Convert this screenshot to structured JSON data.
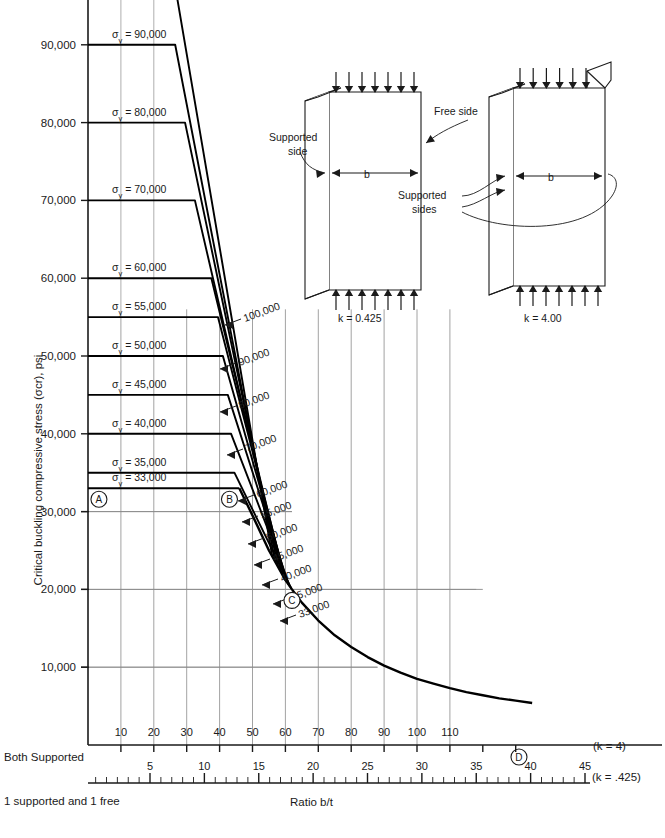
{
  "chart_data": {
    "type": "line",
    "title": "",
    "xlabel": "Ratio  b/t",
    "ylabel": "Critical buckling compressive stress (σcr), psi",
    "ylim": [
      0,
      100000
    ],
    "yticks": [
      "100,000",
      "90,000",
      "80,000",
      "70,000",
      "60,000",
      "50,000",
      "40,000",
      "30,000",
      "20,000",
      "10,000"
    ],
    "ytick_values": [
      100000,
      90000,
      80000,
      70000,
      60000,
      50000,
      40000,
      30000,
      20000,
      10000
    ],
    "xaxis_primary": {
      "note": "Both  Supported",
      "k_label": "(k  =  4)",
      "ticks": [
        10,
        20,
        30,
        40,
        50,
        60,
        70,
        80,
        90,
        100,
        110
      ],
      "tick_labels": [
        "10",
        "20",
        "30",
        "40",
        "50",
        "60",
        "70",
        "80",
        "90",
        "100",
        "110"
      ],
      "range": [
        0,
        135
      ]
    },
    "xaxis_secondary": {
      "note": "1 supported and 1 free",
      "k_label": "(k = .425)",
      "ticks": [
        5,
        10,
        15,
        20,
        25,
        30,
        35,
        40,
        45
      ],
      "tick_labels": [
        "5",
        "10",
        "15",
        "20",
        "25",
        "30",
        "35",
        "40",
        "45"
      ],
      "range": [
        0,
        46.5
      ]
    },
    "gridlines": {
      "x": [
        10,
        20,
        30,
        40,
        50,
        60,
        70,
        80,
        90,
        100,
        110
      ],
      "y": [
        10000,
        20000,
        30000,
        60000
      ]
    },
    "series": [
      {
        "name": "100,000",
        "sigma_y": 100000,
        "plateau_label": "σy = 100,000",
        "curve_label": "100,000",
        "break_bt": 25.5
      },
      {
        "name": "90,000",
        "sigma_y": 90000,
        "plateau_label": "σy = 90,000",
        "curve_label": "90,000",
        "break_bt": 26.5
      },
      {
        "name": "80,000",
        "sigma_y": 80000,
        "plateau_label": "σy = 80,000",
        "curve_label": "80,000",
        "break_bt": 29.5
      },
      {
        "name": "70,000",
        "sigma_y": 70000,
        "plateau_label": "σy = 70,000",
        "curve_label": "70,000",
        "break_bt": 32.5
      },
      {
        "name": "60,000",
        "sigma_y": 60000,
        "plateau_label": "σy = 60,000",
        "curve_label": "60,000",
        "break_bt": 37.5
      },
      {
        "name": "55,000",
        "sigma_y": 55000,
        "plateau_label": "σy = 55,000",
        "curve_label": "55,000",
        "break_bt": 39.5
      },
      {
        "name": "50,000",
        "sigma_y": 50000,
        "plateau_label": "σy = 50,000",
        "curve_label": "50,000",
        "break_bt": 41.0
      },
      {
        "name": "45,000",
        "sigma_y": 45000,
        "plateau_label": "σy = 45,000",
        "curve_label": "45,000",
        "break_bt": 42.5
      },
      {
        "name": "40,000",
        "sigma_y": 40000,
        "plateau_label": "σy = 40,000",
        "curve_label": "40,000",
        "break_bt": 43.5
      },
      {
        "name": "35,000",
        "sigma_y": 35000,
        "plateau_label": "σy = 35,000",
        "curve_label": "35,000",
        "break_bt": 44.5
      },
      {
        "name": "33,000",
        "sigma_y": 33000,
        "plateau_label": "σy = 33,000",
        "curve_label": "33,000",
        "break_bt": 46.0
      }
    ],
    "envelope": {
      "name": "euler-envelope",
      "points_bt_sigma": [
        [
          46,
          33000
        ],
        [
          50,
          29500
        ],
        [
          55,
          25000
        ],
        [
          60,
          21200
        ],
        [
          62,
          20000
        ],
        [
          65,
          18300
        ],
        [
          70,
          16000
        ],
        [
          75,
          14100
        ],
        [
          80,
          12600
        ],
        [
          85,
          11300
        ],
        [
          90,
          10200
        ],
        [
          95,
          9300
        ],
        [
          100,
          8500
        ],
        [
          105,
          7900
        ],
        [
          110,
          7300
        ],
        [
          115,
          6800
        ],
        [
          120,
          6400
        ],
        [
          125,
          6000
        ],
        [
          130,
          5700
        ],
        [
          135,
          5400
        ]
      ]
    },
    "markers": [
      {
        "id": "A",
        "label": "A",
        "bt": 1.5,
        "sigma": 33000
      },
      {
        "id": "B",
        "label": "B",
        "bt": 43.0,
        "sigma": 33000
      },
      {
        "id": "C",
        "label": "C",
        "bt": 62.0,
        "sigma": 20000
      },
      {
        "id": "D",
        "label": "D",
        "bt": 131.0,
        "sigma": 0
      }
    ]
  },
  "diagrams": [
    {
      "id": "plate-one-free",
      "k_label": "k  =  0.425",
      "annotations": [
        {
          "name": "free-side",
          "text": "Free side"
        },
        {
          "name": "supported-side",
          "text": "Supported\nside"
        },
        {
          "name": "width-dim",
          "text": "b"
        }
      ]
    },
    {
      "id": "plate-both-supported",
      "k_label": "k  =  4.00",
      "annotations": [
        {
          "name": "supported-sides",
          "text": "Supported\nsides"
        },
        {
          "name": "width-dim",
          "text": "b"
        }
      ]
    }
  ],
  "text": {
    "supported_side_l1": "Supported",
    "supported_side_l2": "side",
    "supported_sides_l1": "Supported",
    "supported_sides_l2": "sides",
    "free_side": "Free side",
    "b_dim": "b",
    "k_left": "k  =  0.425",
    "k_right": "k  =  4.00",
    "both_supported": "Both  Supported",
    "one_supported_one_free": "1 supported and 1 free",
    "ratio": "Ratio   b/t",
    "k4": "(k  =  4)",
    "k425": "(k = .425)",
    "ylabel": "Critical buckling compressive stress (σcr), psi"
  },
  "colors": {
    "ink": "#1a1a1a",
    "grid": "#8a8a8a",
    "curve": "#000000"
  }
}
